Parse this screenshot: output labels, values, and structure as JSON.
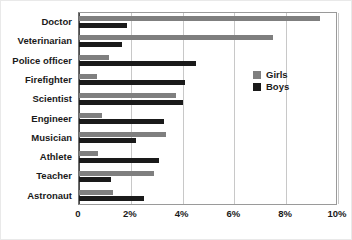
{
  "chart_data": {
    "type": "bar",
    "orientation": "horizontal",
    "title": "",
    "xlabel": "",
    "ylabel": "",
    "xlim": [
      0,
      10
    ],
    "xticks": [
      "0",
      "2%",
      "4%",
      "6%",
      "8%",
      "10%"
    ],
    "xtick_values": [
      0,
      2,
      4,
      6,
      8,
      10
    ],
    "grid": "vertical",
    "legend_position": "center-right",
    "categories": [
      "Doctor",
      "Veterinarian",
      "Police officer",
      "Firefighter",
      "Scientist",
      "Engineer",
      "Musician",
      "Athlete",
      "Teacher",
      "Astronaut"
    ],
    "series": [
      {
        "name": "Girls",
        "color": "#7f7f7f",
        "values": [
          9.3,
          7.5,
          1.15,
          0.7,
          3.75,
          0.9,
          3.35,
          0.75,
          2.9,
          1.3
        ]
      },
      {
        "name": "Boys",
        "color": "#1a1a1a",
        "values": [
          1.85,
          1.65,
          4.5,
          4.1,
          4.0,
          3.3,
          2.2,
          3.1,
          1.25,
          2.5
        ]
      }
    ]
  },
  "legend": {
    "items": [
      {
        "label": "Girls",
        "color": "#7f7f7f",
        "swatch": "legend-swatch-girls"
      },
      {
        "label": "Boys",
        "color": "#1a1a1a",
        "swatch": "legend-swatch-boys"
      }
    ]
  },
  "colors": {
    "girls": "#7f7f7f",
    "boys": "#1a1a1a",
    "grid": "#c8c8c8",
    "axis": "#4a4a4a",
    "background": "#ffffff",
    "text": "#1a1a1a"
  }
}
